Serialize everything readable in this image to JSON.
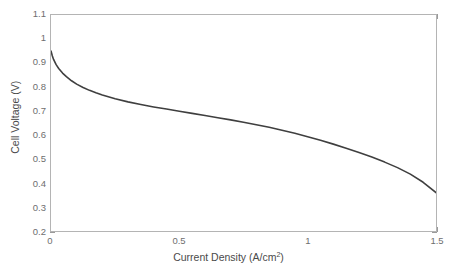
{
  "chart_data": {
    "type": "line",
    "title": "",
    "subtitle": "",
    "xlabel": "Current Density (A/cm²)",
    "xlabel_base": "Current Density (A/cm",
    "xlabel_sup": "2",
    "xlabel_tail": ")",
    "ylabel": "Cell Voltage (V)",
    "xlim": [
      0,
      1.5
    ],
    "ylim": [
      0.2,
      1.1
    ],
    "xticks": [
      0,
      0.5,
      1,
      1.5
    ],
    "xtick_labels": [
      "0",
      "0.5",
      "1",
      "1.5"
    ],
    "yticks": [
      0.2,
      0.3,
      0.4,
      0.5,
      0.6,
      0.7,
      0.8,
      0.9,
      1.0,
      1.1
    ],
    "ytick_labels": [
      "0.2",
      "0.3",
      "0.4",
      "0.5",
      "0.6",
      "0.7",
      "0.8",
      "0.9",
      "1",
      "1.1"
    ],
    "grid": false,
    "legend": null,
    "legend_position": "none",
    "annotations": [],
    "series": [
      {
        "name": "Polarization curve",
        "color": "#3f3f3f",
        "line_width": 1.6,
        "x": [
          0.0,
          0.005,
          0.01,
          0.02,
          0.03,
          0.045,
          0.06,
          0.08,
          0.1,
          0.125,
          0.15,
          0.175,
          0.2,
          0.25,
          0.3,
          0.35,
          0.4,
          0.45,
          0.5,
          0.55,
          0.6,
          0.65,
          0.7,
          0.75,
          0.8,
          0.85,
          0.9,
          0.95,
          1.0,
          1.05,
          1.1,
          1.15,
          1.2,
          1.25,
          1.3,
          1.35,
          1.4,
          1.45,
          1.5
        ],
        "y": [
          0.95,
          0.93,
          0.915,
          0.893,
          0.877,
          0.858,
          0.843,
          0.826,
          0.812,
          0.798,
          0.786,
          0.776,
          0.767,
          0.751,
          0.738,
          0.727,
          0.717,
          0.708,
          0.699,
          0.69,
          0.681,
          0.672,
          0.663,
          0.653,
          0.643,
          0.632,
          0.62,
          0.607,
          0.593,
          0.578,
          0.562,
          0.545,
          0.527,
          0.508,
          0.487,
          0.464,
          0.437,
          0.403,
          0.36
        ]
      }
    ]
  },
  "axes": {
    "box_color": "#b4b4b4",
    "tick_color": "#9a9a9a",
    "tick_label_color": "#6e6e6e",
    "axis_title_color": "#4a4a4a",
    "background": "#ffffff"
  }
}
